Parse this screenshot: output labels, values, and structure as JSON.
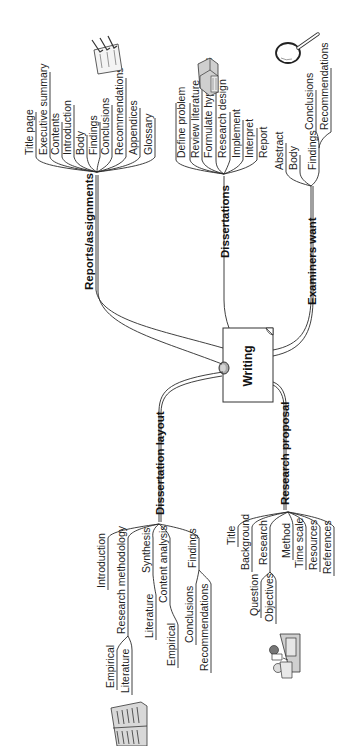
{
  "central": {
    "label": "Writing"
  },
  "branches": {
    "reports": {
      "label": "Reports/assignments",
      "items": [
        "Title page",
        "Executive summary",
        "Contents",
        "Introduction",
        "Body",
        "Findings",
        "Conclusions",
        "Recommendations",
        "Appendices",
        "Glossary"
      ]
    },
    "dissertations": {
      "label": "Dissertations",
      "items": [
        "Define problem",
        "Review literature",
        "Formulate hypothesis",
        "Research design",
        "Implement",
        "Interpret",
        "Report"
      ]
    },
    "examiners": {
      "label": "Examiners want",
      "items": [
        "Abstract",
        "Body",
        "Findings"
      ],
      "findings_children": [
        "Conclusions",
        "Recommendations"
      ]
    },
    "layout": {
      "label": "Dissertation layout",
      "items": [
        "Introduction",
        "Research methodology",
        "Synthesis",
        "Content analysis",
        "Findings"
      ],
      "methodology_children": [
        "Empirical",
        "Literature"
      ],
      "synthesis_children": [
        "Literature"
      ],
      "content_children": [
        "Empirical"
      ],
      "findings_children": [
        "Conclusions",
        "Recommendations"
      ]
    },
    "proposal": {
      "label": "Research proposal",
      "items": [
        "Title",
        "Background",
        "Research",
        "Method",
        "Time scale",
        "Resources",
        "References"
      ],
      "research_children": [
        "Question",
        "Objectives"
      ]
    }
  },
  "icons": [
    "checklist-icon",
    "book-stack-icon",
    "magnifier-icon",
    "open-book-icon",
    "people-at-desk-icon"
  ]
}
